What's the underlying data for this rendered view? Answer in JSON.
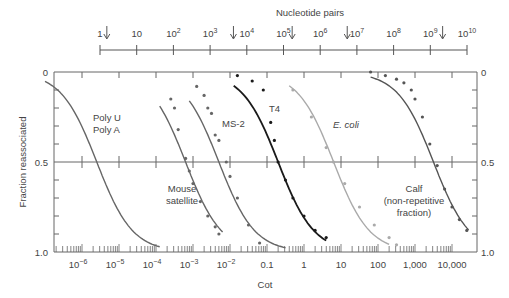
{
  "chart_data": {
    "type": "line",
    "title": "",
    "top_axis": {
      "label": "Nucleotide pairs",
      "ticks": [
        "1",
        "10",
        "10^2",
        "10^3",
        "10^4",
        "10^5",
        "10^6",
        "10^7",
        "10^8",
        "10^9",
        "10^10"
      ],
      "arrows_at_log": [
        0.05,
        3.5,
        5.1,
        6.6,
        9.2
      ]
    },
    "xlabel": "Cot",
    "ylabel": "Fraction reassociated",
    "x_scale": "log",
    "x_ticks": [
      "10^-6",
      "10^-5",
      "10^-4",
      "10^-3",
      "10^-2",
      "0.1",
      "1",
      "10",
      "100",
      "1,000",
      "10,000"
    ],
    "xlim_log": [
      -7,
      4.7
    ],
    "y_ticks": [
      "0",
      "0.5",
      "1.0"
    ],
    "ylim": [
      0,
      1
    ],
    "y_inverted": true,
    "grid": "midline at 0.5",
    "series": [
      {
        "name": "Poly U / Poly A",
        "color": "#666666",
        "cot_half_log": -5.6,
        "points": []
      },
      {
        "name": "Mouse satellite",
        "color": "#666666",
        "cot_half_log": -3.2,
        "points": [
          [
            -3.6,
            0.15
          ],
          [
            -3.5,
            0.2
          ],
          [
            -3.4,
            0.32
          ],
          [
            -3.2,
            0.48
          ],
          [
            -3.1,
            0.55
          ],
          [
            -3.0,
            0.62
          ],
          [
            -2.8,
            0.72
          ],
          [
            -2.6,
            0.8
          ],
          [
            -2.4,
            0.86
          ],
          [
            -2.3,
            0.9
          ]
        ]
      },
      {
        "name": "MS-2",
        "color": "#666666",
        "cot_half_log": -2.3,
        "points": [
          [
            -2.9,
            0.08
          ],
          [
            -2.7,
            0.13
          ],
          [
            -2.6,
            0.2
          ],
          [
            -2.5,
            0.23
          ],
          [
            -2.4,
            0.35
          ],
          [
            -2.3,
            0.38
          ],
          [
            -2.1,
            0.5
          ],
          [
            -2.0,
            0.58
          ],
          [
            -1.8,
            0.7
          ],
          [
            -1.5,
            0.85
          ],
          [
            -1.2,
            0.95
          ]
        ]
      },
      {
        "name": "T4",
        "color": "#1a1a1a",
        "cot_half_log": -0.7,
        "points": [
          [
            -1.8,
            0.02
          ],
          [
            -1.4,
            0.05
          ],
          [
            -1.1,
            0.1
          ],
          [
            -0.9,
            0.28
          ],
          [
            -0.8,
            0.38
          ],
          [
            -0.7,
            0.5
          ],
          [
            -0.5,
            0.6
          ],
          [
            -0.3,
            0.7
          ],
          [
            0.0,
            0.8
          ],
          [
            0.3,
            0.88
          ],
          [
            0.6,
            0.92
          ]
        ]
      },
      {
        "name": "E. coli",
        "color": "#aaaaaa",
        "cot_half_log": 0.8,
        "points": [
          [
            -0.3,
            0.1
          ],
          [
            0.2,
            0.25
          ],
          [
            0.6,
            0.42
          ],
          [
            0.8,
            0.5
          ],
          [
            1.1,
            0.62
          ],
          [
            1.5,
            0.75
          ],
          [
            1.9,
            0.85
          ],
          [
            2.3,
            0.92
          ],
          [
            2.5,
            0.96
          ]
        ]
      },
      {
        "name": "Calf (non-repetitive fraction)",
        "color": "#555555",
        "cot_half_log": 3.5,
        "points": [
          [
            1.8,
            0.0
          ],
          [
            2.2,
            0.02
          ],
          [
            2.5,
            0.04
          ],
          [
            2.7,
            0.06
          ],
          [
            2.9,
            0.1
          ],
          [
            3.0,
            0.15
          ],
          [
            3.2,
            0.25
          ],
          [
            3.4,
            0.4
          ],
          [
            3.6,
            0.52
          ],
          [
            3.8,
            0.65
          ],
          [
            4.0,
            0.75
          ],
          [
            4.2,
            0.82
          ],
          [
            4.4,
            0.88
          ]
        ]
      }
    ],
    "annotations": [
      "Poly U",
      "Poly A",
      "MS-2",
      "T4",
      "E. coli",
      "Mouse satellite",
      "Calf",
      "(non-repetitive",
      "fraction)"
    ]
  },
  "labels": {
    "top_axis_title": "Nucleotide pairs",
    "top_ticks": [
      "1",
      "10",
      "10",
      "10",
      "10",
      "10",
      "10",
      "10",
      "10",
      "10",
      "10"
    ],
    "top_exps": [
      "",
      "",
      "2",
      "3",
      "4",
      "5",
      "6",
      "7",
      "8",
      "9",
      "10"
    ],
    "y_left": [
      "0",
      "0.5",
      "1.0"
    ],
    "y_right": [
      "0",
      "0.5",
      "1.0"
    ],
    "ylabel": "Fraction reassociated",
    "xlabel": "Cot",
    "x_ticks_base": [
      "10",
      "10",
      "10",
      "10",
      "10"
    ],
    "x_ticks_exp": [
      "−6",
      "−5",
      "−4",
      "−3",
      "−2"
    ],
    "x_ticks_plain": [
      "0.1",
      "1",
      "10",
      "100",
      "1,000",
      "10,000"
    ],
    "poly_u": "Poly U",
    "poly_a": "Poly A",
    "ms2": "MS-2",
    "t4": "T4",
    "ecoli": "E. coli",
    "mouse1": "Mouse",
    "mouse2": "satellite",
    "calf1": "Calf",
    "calf2": "(non-repetitive",
    "calf3": "fraction)"
  }
}
